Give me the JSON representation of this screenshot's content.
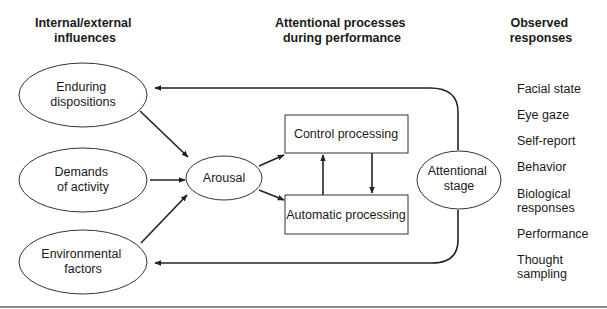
{
  "headers": {
    "influences": [
      "Internal/external",
      "influences"
    ],
    "processes": [
      "Attentional processes",
      "during performance"
    ],
    "responses": [
      "Observed",
      "responses"
    ]
  },
  "influences": {
    "enduring": [
      "Enduring",
      "dispositions"
    ],
    "demands": [
      "Demands",
      "of activity"
    ],
    "environmental": [
      "Environmental",
      "factors"
    ]
  },
  "processes": {
    "arousal": "Arousal",
    "control": "Control processing",
    "automatic": "Automatic processing",
    "attentional_stage": [
      "Attentional",
      "stage"
    ]
  },
  "responses": [
    [
      "Facial state"
    ],
    [
      "Eye gaze"
    ],
    [
      "Self-report"
    ],
    [
      "Behavior"
    ],
    [
      "Biological",
      "responses"
    ],
    [
      "Performance"
    ],
    [
      "Thought",
      "sampling"
    ]
  ],
  "colors": {
    "stroke": "#333333",
    "text": "#1a1a1a",
    "rule": "#8a8a8a"
  }
}
